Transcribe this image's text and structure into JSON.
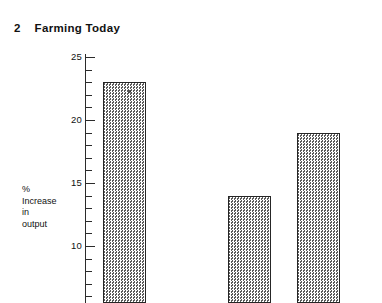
{
  "page": {
    "background_color": "#ffffff",
    "width": 382,
    "height": 303
  },
  "header": {
    "chapter_number": "2",
    "title": "Farming Today"
  },
  "chart_data": {
    "type": "bar",
    "title": "Farming Today",
    "xlabel": "",
    "ylabel": "% Increase in output",
    "ylabel_lines": [
      "%",
      "Increase",
      "in",
      "output"
    ],
    "categories": [
      "",
      "",
      ""
    ],
    "values": [
      23,
      14,
      19
    ],
    "ylim": [
      5,
      25
    ],
    "y_ticks_major": [
      25,
      20,
      15,
      10,
      5
    ],
    "y_tick_labels": [
      "25",
      "20",
      "15",
      "10",
      "5"
    ],
    "y_tick_interval_minor": 1,
    "grid": false,
    "legend": false,
    "bar_fill": "halftone-checker",
    "bar_border_color": "#262626",
    "note": "Bottom of chart is cropped by the page edge; x-axis and category labels are not visible."
  },
  "axis": {
    "line_color": "#2b2b2b"
  }
}
